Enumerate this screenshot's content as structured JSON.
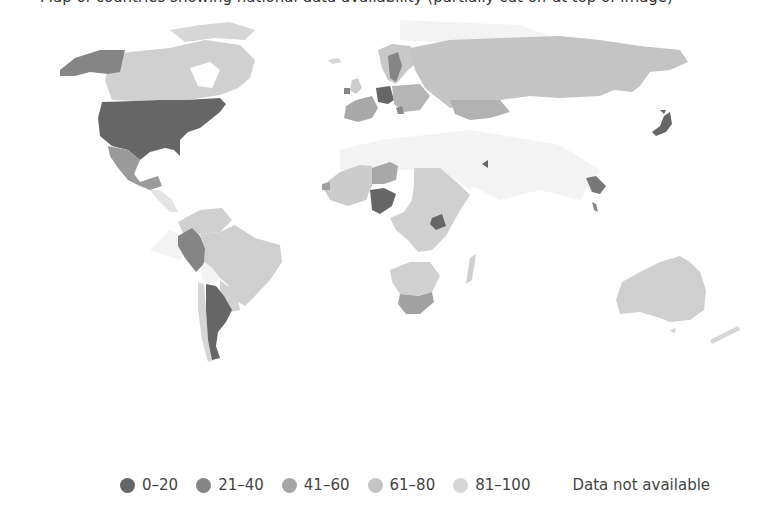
{
  "caption": {
    "text": "Map of countries showing national data availability (partially cut off at top of image)"
  },
  "colors": {
    "c0_20": "#666666",
    "c21_40": "#858585",
    "c41_60": "#a6a6a6",
    "c61_80": "#c4c4c4",
    "c81_100": "#d6d6d6",
    "na": "#f2f2f2"
  },
  "legend": {
    "items": [
      {
        "label": "0–20",
        "color": "#666666"
      },
      {
        "label": "21–40",
        "color": "#858585"
      },
      {
        "label": "41–60",
        "color": "#a6a6a6"
      },
      {
        "label": "61–80",
        "color": "#c4c4c4"
      },
      {
        "label": "81–100",
        "color": "#d6d6d6"
      }
    ],
    "not_available": "Data not available"
  },
  "map": {
    "regions": [
      {
        "name": "United States",
        "bin": "0-20"
      },
      {
        "name": "Alaska",
        "bin": "21-40"
      },
      {
        "name": "Canada",
        "bin": "81-100"
      },
      {
        "name": "Mexico",
        "bin": "41-60"
      },
      {
        "name": "Brazil",
        "bin": "81-100"
      },
      {
        "name": "Peru",
        "bin": "21-40"
      },
      {
        "name": "Argentina",
        "bin": "0-20"
      },
      {
        "name": "Colombia/Venezuela",
        "bin": "81-100"
      },
      {
        "name": "Uruguay/Paraguay",
        "bin": "81-100"
      },
      {
        "name": "Chile",
        "bin": "81-100"
      },
      {
        "name": "Germany",
        "bin": "0-20"
      },
      {
        "name": "Sweden",
        "bin": "21-40"
      },
      {
        "name": "Russia",
        "bin": "61-80"
      },
      {
        "name": "Kazakhstan",
        "bin": "41-60"
      },
      {
        "name": "Japan",
        "bin": "0-20"
      },
      {
        "name": "Nigeria",
        "bin": "0-20"
      },
      {
        "name": "Niger",
        "bin": "41-60"
      },
      {
        "name": "Uganda",
        "bin": "0-20"
      },
      {
        "name": "South Africa",
        "bin": "41-60"
      },
      {
        "name": "Central/East Africa",
        "bin": "81-100"
      },
      {
        "name": "Thailand",
        "bin": "0-20"
      },
      {
        "name": "Australia",
        "bin": "81-100"
      },
      {
        "name": "New Zealand",
        "bin": "81-100"
      }
    ]
  }
}
